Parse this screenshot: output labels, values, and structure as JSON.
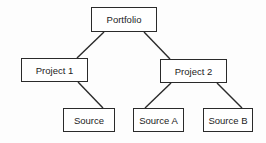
{
  "diagram": {
    "type": "tree",
    "nodes": [
      {
        "id": "portfolio",
        "label": "Portfolio",
        "x": 91,
        "y": 7,
        "w": 66,
        "h": 25
      },
      {
        "id": "project1",
        "label": "Project 1",
        "x": 21,
        "y": 58,
        "w": 67,
        "h": 24
      },
      {
        "id": "project2",
        "label": "Project 2",
        "x": 160,
        "y": 59,
        "w": 67,
        "h": 24
      },
      {
        "id": "source",
        "label": "Source",
        "x": 63,
        "y": 108,
        "w": 52,
        "h": 24
      },
      {
        "id": "sourceA",
        "label": "Source A",
        "x": 133,
        "y": 108,
        "w": 51,
        "h": 24
      },
      {
        "id": "sourceB",
        "label": "Source B",
        "x": 203,
        "y": 108,
        "w": 50,
        "h": 24
      }
    ],
    "edges": [
      {
        "from": "portfolio",
        "to": "project1"
      },
      {
        "from": "portfolio",
        "to": "project2"
      },
      {
        "from": "project1",
        "to": "source"
      },
      {
        "from": "project2",
        "to": "sourceA"
      },
      {
        "from": "project2",
        "to": "sourceB"
      }
    ]
  }
}
